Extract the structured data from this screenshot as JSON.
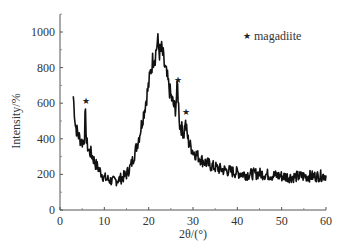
{
  "chart_data": {
    "type": "line",
    "title": "",
    "xlabel": "2θ/(°)",
    "ylabel": "Intensity/%",
    "xlim": [
      0,
      60
    ],
    "ylim": [
      0,
      1100
    ],
    "xticks": [
      0,
      10,
      20,
      30,
      40,
      50,
      60
    ],
    "yticks": [
      0,
      200,
      400,
      600,
      800,
      1000
    ],
    "grid": false,
    "legend": {
      "position": "top-right",
      "entries": [
        {
          "marker": "★",
          "label": "magadiite"
        }
      ]
    },
    "annotations": [
      {
        "marker": "★",
        "x": 5.7,
        "y": 610,
        "label": "magadiite"
      },
      {
        "marker": "★",
        "x": 26.5,
        "y": 730,
        "label": "magadiite"
      },
      {
        "marker": "★",
        "x": 28.2,
        "y": 550,
        "label": "magadiite"
      }
    ],
    "series": [
      {
        "name": "XRD pattern",
        "color": "#111111",
        "x": [
          3,
          3.5,
          4,
          4.5,
          5,
          5.5,
          5.7,
          6,
          6.5,
          7,
          8,
          9,
          10,
          11,
          12,
          13,
          14,
          15,
          16,
          17,
          18,
          19,
          20,
          20.5,
          21,
          21.5,
          22,
          22.5,
          23,
          23.5,
          24,
          25,
          26,
          26.5,
          27,
          28,
          28.2,
          29,
          30,
          32,
          34,
          36,
          38,
          40,
          42,
          45,
          48,
          50,
          52,
          55,
          58,
          60
        ],
        "values": [
          640,
          470,
          430,
          400,
          380,
          400,
          560,
          380,
          330,
          320,
          260,
          220,
          180,
          170,
          160,
          170,
          180,
          200,
          250,
          330,
          430,
          560,
          700,
          790,
          850,
          870,
          950,
          880,
          900,
          820,
          760,
          640,
          560,
          700,
          480,
          430,
          500,
          380,
          330,
          280,
          250,
          230,
          220,
          210,
          200,
          205,
          195,
          190,
          185,
          190,
          190,
          195
        ]
      }
    ]
  }
}
